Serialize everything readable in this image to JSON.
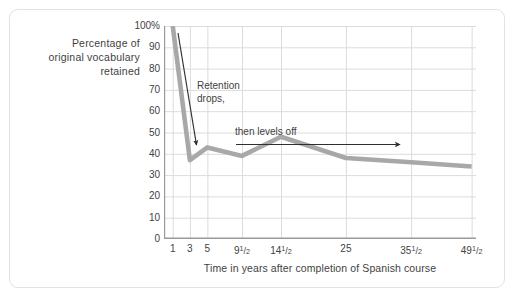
{
  "figure": {
    "y_caption_lines": [
      "Percentage of",
      "original vocabulary",
      "retained"
    ],
    "x_title": "Time in years after completion of Spanish course",
    "annotations": [
      {
        "name": "retention-drops",
        "lines": [
          "Retention",
          "drops,"
        ]
      },
      {
        "name": "then-levels-off",
        "lines": [
          "then levels off"
        ]
      }
    ]
  },
  "chart_data": {
    "type": "line",
    "title": "",
    "xlabel": "Time in years after completion of Spanish course",
    "ylabel": "Percentage of original vocabulary retained",
    "ylim": [
      0,
      100
    ],
    "ytick_values": [
      0,
      10,
      20,
      30,
      40,
      50,
      60,
      70,
      80,
      90,
      100
    ],
    "ytick_labels": [
      "0",
      "10",
      "20",
      "30",
      "40",
      "50",
      "60",
      "70",
      "80",
      "90",
      "100%"
    ],
    "xtick_labels": [
      "1",
      "3",
      "5",
      "9½",
      "14½",
      "25",
      "35½",
      "49½"
    ],
    "xtick_label_parts": [
      {
        "whole": "1",
        "num": "",
        "den": ""
      },
      {
        "whole": "3",
        "num": "",
        "den": ""
      },
      {
        "whole": "5",
        "num": "",
        "den": ""
      },
      {
        "whole": "9",
        "num": "1",
        "den": "2"
      },
      {
        "whole": "14",
        "num": "1",
        "den": "2"
      },
      {
        "whole": "25",
        "num": "",
        "den": ""
      },
      {
        "whole": "35",
        "num": "1",
        "den": "2"
      },
      {
        "whole": "49",
        "num": "1",
        "den": "2"
      }
    ],
    "x": [
      1,
      3,
      5,
      9.5,
      14.5,
      25,
      35.5,
      49.5
    ],
    "y": [
      100,
      37,
      43,
      39,
      48,
      38,
      36,
      34
    ],
    "grid": true,
    "legend": "none",
    "series": [
      {
        "name": "Percentage of original vocabulary retained",
        "color": "#a8a8a8",
        "values": [
          100,
          37,
          43,
          39,
          48,
          38,
          36,
          34
        ]
      }
    ],
    "annotations": [
      {
        "text": "Retention drops,",
        "arrow": "down-right"
      },
      {
        "text": "then levels off",
        "arrow": "right"
      }
    ]
  },
  "colors": {
    "line": "#a8a8a8",
    "grid": "#dcdcdc",
    "axis": "#9a9a9a",
    "frame": "#e2e2e2",
    "text": "#3f3f3f",
    "arrow": "#2e2e2e",
    "background": "#ffffff"
  }
}
